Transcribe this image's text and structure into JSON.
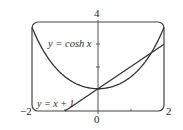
{
  "chart_data": {
    "type": "line",
    "title": "",
    "xlabel": "",
    "ylabel": "",
    "xlim": [
      -2,
      2
    ],
    "ylim": [
      0,
      4
    ],
    "grid": false,
    "x_tick_labels": [
      "-2",
      "0",
      "2"
    ],
    "y_tick_labels": [
      "4"
    ],
    "x_ticks": [
      -2,
      -1,
      0,
      1,
      2
    ],
    "y_ticks": [
      0,
      1,
      2,
      3,
      4
    ],
    "series": [
      {
        "name": "y = cosh x",
        "function": "cosh(x)",
        "x": [
          -2,
          -1.5,
          -1,
          -0.5,
          0,
          0.5,
          1,
          1.5,
          2
        ],
        "values": [
          3.76,
          2.35,
          1.54,
          1.13,
          1.0,
          1.13,
          1.54,
          2.35,
          3.76
        ]
      },
      {
        "name": "y = x + 1",
        "function": "x + 1",
        "x": [
          -1,
          0,
          1,
          2
        ],
        "values": [
          0,
          1,
          2,
          3
        ]
      }
    ],
    "annotations": [
      {
        "text": "y = cosh x",
        "near": [
          -1.2,
          3.1
        ]
      },
      {
        "text": "y = x + 1",
        "near": [
          -1.5,
          0.3
        ]
      }
    ],
    "intersections": [
      [
        0,
        1
      ],
      [
        1.62,
        2.62
      ]
    ]
  },
  "labels": {
    "cosh": "y = cosh x",
    "line": "y = x + 1",
    "x_min": "−2",
    "x_zero": "0",
    "x_max": "2",
    "y_max": "4"
  },
  "colors": {
    "curve": "#333333",
    "frame": "#444444",
    "axis": "#555555"
  }
}
